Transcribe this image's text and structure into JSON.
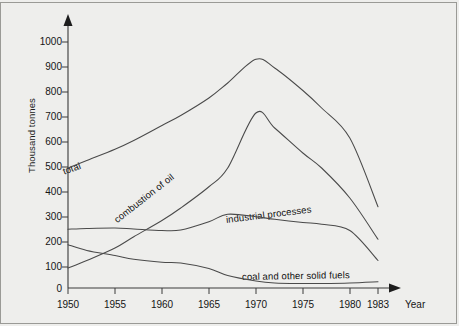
{
  "chart_data": {
    "type": "line",
    "title": "",
    "xlabel": "Year",
    "ylabel": "Thousand tonnes",
    "xlim": [
      1950,
      1983
    ],
    "ylim": [
      0,
      1000
    ],
    "grid": false,
    "legend_position": "inline-labels",
    "y_ticks": [
      0,
      100,
      200,
      300,
      400,
      500,
      600,
      700,
      800,
      900,
      1000
    ],
    "x_ticks": [
      1950,
      1955,
      1960,
      1965,
      1970,
      1975,
      1980,
      1983
    ],
    "x": [
      1950,
      1952,
      1955,
      1957,
      1960,
      1962,
      1965,
      1967,
      1970,
      1972,
      1975,
      1977,
      1980,
      1983
    ],
    "series": [
      {
        "name": "total",
        "label": "total",
        "values": [
          480,
          510,
          555,
          590,
          650,
          690,
          760,
          820,
          915,
          880,
          790,
          720,
          600,
          325
        ]
      },
      {
        "name": "combustion of oil",
        "label": "combustion of oil",
        "values": [
          80,
          110,
          160,
          205,
          270,
          320,
          405,
          480,
          700,
          640,
          540,
          480,
          360,
          195
        ]
      },
      {
        "name": "industrial processes",
        "label": "industrial processes",
        "values": [
          235,
          238,
          240,
          236,
          230,
          232,
          265,
          295,
          285,
          275,
          262,
          255,
          230,
          110
        ]
      },
      {
        "name": "coal and other solid fuels",
        "label": "coal and other solid fuels",
        "values": [
          173,
          150,
          130,
          115,
          103,
          100,
          78,
          50,
          28,
          20,
          18,
          18,
          20,
          25
        ]
      }
    ]
  },
  "axes": {
    "y_axis_title": "Thousand tonnes",
    "x_axis_title": "Year",
    "y_tick_labels": [
      "1000",
      "900",
      "800",
      "700",
      "600",
      "500",
      "400",
      "300",
      "200",
      "100",
      "0"
    ],
    "x_tick_labels": [
      "1950",
      "1955",
      "1960",
      "1965",
      "1970",
      "1975",
      "1980",
      "1983"
    ]
  },
  "series_labels": {
    "total": "total",
    "oil": "combustion of oil",
    "industrial": "industrial processes",
    "coal": "coal and other solid fuels"
  },
  "colors": {
    "background": "#eeeeec",
    "curve": "#4a4a4a",
    "axis": "#3a3a3a",
    "text": "#151515",
    "frame": "#9a9a96"
  }
}
